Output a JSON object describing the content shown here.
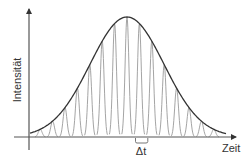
{
  "diagram": {
    "type": "pulse-train-with-gaussian-envelope",
    "y_axis_label": "Intensität",
    "x_axis_label": "Zeit",
    "interval_label": "Δt",
    "pulse_count": 15,
    "envelope_shape": "gaussian",
    "colors": {
      "axis": "#555555",
      "envelope": "#333333",
      "pulses": "#9a9a9a",
      "text": "#333333"
    }
  }
}
